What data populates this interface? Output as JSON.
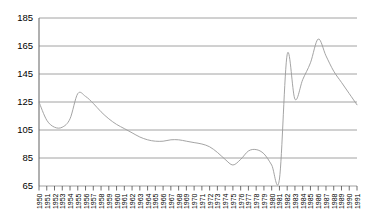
{
  "chart_data": {
    "type": "line",
    "title": "",
    "subtitle": "",
    "xlabel": "",
    "ylabel": "",
    "xlim": [
      1950,
      1991
    ],
    "ylim": [
      65,
      185
    ],
    "yticks": [
      65,
      85,
      105,
      125,
      145,
      165,
      185
    ],
    "grid": true,
    "legend": "none",
    "line_color": "#9a9a9a",
    "categories": [
      "1950",
      "1951",
      "1952",
      "1953",
      "1954",
      "1955",
      "1956",
      "1957",
      "1958",
      "1959",
      "1960",
      "1961",
      "1962",
      "1963",
      "1964",
      "1965",
      "1966",
      "1967",
      "1968",
      "1969",
      "1970",
      "1971",
      "1972",
      "1973",
      "1974",
      "1975",
      "1976",
      "1977",
      "1978",
      "1979",
      "1980",
      "1981",
      "1982",
      "1983",
      "1984",
      "1985",
      "1986",
      "1987",
      "1988",
      "1989",
      "1990",
      "1991"
    ],
    "series": [
      {
        "name": "series-1",
        "values": [
          125,
          112,
          107,
          107,
          113,
          131,
          129,
          124,
          118,
          113,
          109,
          106,
          103,
          100,
          98,
          97,
          97,
          98,
          98,
          97,
          96,
          95,
          93,
          89,
          84,
          80,
          84,
          90,
          91,
          88,
          80,
          70,
          159,
          127,
          141,
          153,
          170,
          158,
          147,
          139,
          131,
          123
        ]
      }
    ]
  }
}
